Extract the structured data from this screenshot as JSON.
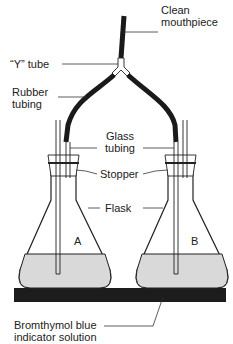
{
  "diagram": {
    "labels": {
      "mouthpiece_line1": "Clean",
      "mouthpiece_line2": "mouthpiece",
      "y_tube": "“Y” tube",
      "rubber_line1": "Rubber",
      "rubber_line2": "tubing",
      "glass_line1": "Glass",
      "glass_line2": "tubing",
      "stopper": "Stopper",
      "flask": "Flask",
      "indicator_line1": "Bromthymol blue",
      "indicator_line2": "indicator solution"
    },
    "flasks": [
      {
        "id": "A",
        "label": "A"
      },
      {
        "id": "B",
        "label": "B"
      }
    ],
    "colors": {
      "line": "#222222",
      "tubing": "#1a1a1a",
      "liquid": "#d9d9d9",
      "base": "#1c1c1c",
      "background": "#ffffff"
    }
  }
}
